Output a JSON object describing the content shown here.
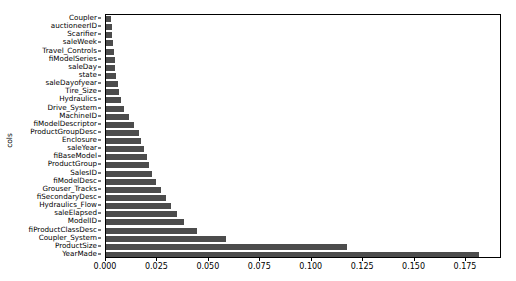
{
  "chart_data": {
    "type": "bar",
    "orientation": "horizontal",
    "title": "",
    "xlabel": "",
    "ylabel": "cols",
    "xlim": [
      0.0,
      0.1925
    ],
    "grid": false,
    "legend": null,
    "bar_color": "#4c4c4c",
    "xticks": [
      "0.000",
      "0.025",
      "0.050",
      "0.075",
      "0.100",
      "0.125",
      "0.150",
      "0.175"
    ],
    "xtick_values": [
      0.0,
      0.025,
      0.05,
      0.075,
      0.1,
      0.125,
      0.15,
      0.175
    ],
    "categories": [
      "Coupler",
      "auctioneerID",
      "Scarifier",
      "saleWeek",
      "Travel_Controls",
      "fiModelSeries",
      "saleDay",
      "state",
      "saleDayofyear",
      "Tire_Size",
      "Hydraulics",
      "Drive_System",
      "MachineID",
      "fiModelDescriptor",
      "ProductGroupDesc",
      "Enclosure",
      "saleYear",
      "fiBaseModel",
      "ProductGroup",
      "SalesID",
      "fiModelDesc",
      "Grouser_Tracks",
      "fiSecondaryDesc",
      "Hydraulics_Flow",
      "saleElapsed",
      "ModelID",
      "fiProductClassDesc",
      "Coupler_System",
      "ProductSize",
      "YearMade"
    ],
    "values": [
      0.0022,
      0.0028,
      0.0031,
      0.0034,
      0.0038,
      0.0042,
      0.0046,
      0.0051,
      0.0058,
      0.0065,
      0.0072,
      0.0086,
      0.0113,
      0.0136,
      0.0158,
      0.0172,
      0.0186,
      0.0201,
      0.021,
      0.0223,
      0.0241,
      0.0267,
      0.0292,
      0.0318,
      0.0345,
      0.0379,
      0.0442,
      0.0582,
      0.1172,
      0.1815
    ]
  }
}
